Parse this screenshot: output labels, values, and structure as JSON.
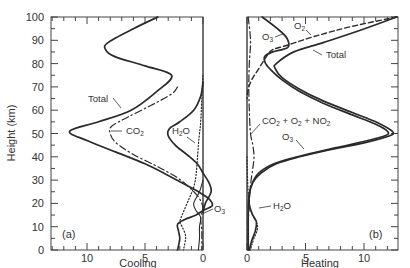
{
  "chart_data": [
    {
      "type": "line",
      "panel_label": "(a)",
      "xlabel": "Cooling",
      "ylabel": "Height (km)",
      "xlim": [
        13.7,
        -0.5
      ],
      "ylim": [
        0,
        100
      ],
      "x_ticks": [
        10,
        5,
        0
      ],
      "y_ticks": [
        0,
        10,
        20,
        30,
        40,
        50,
        60,
        70,
        80,
        90,
        100
      ],
      "x_reversed": true,
      "grid": false,
      "series": [
        {
          "name": "Total",
          "style": "solid",
          "points": [
            [
              3.9,
              100
            ],
            [
              6,
              95
            ],
            [
              8.2,
              89
            ],
            [
              8.4,
              86
            ],
            [
              7.6,
              83
            ],
            [
              5,
              79
            ],
            [
              2.7,
              75
            ],
            [
              4,
              68
            ],
            [
              6.2,
              60
            ],
            [
              9,
              55
            ],
            [
              11.5,
              51
            ],
            [
              10,
              47
            ],
            [
              7.5,
              42
            ],
            [
              5,
              37
            ],
            [
              3,
              32
            ],
            [
              1.5,
              28
            ],
            [
              0.4,
              25
            ],
            [
              -0.5,
              22
            ],
            [
              -0.8,
              19
            ],
            [
              0,
              17
            ],
            [
              0.6,
              15
            ],
            [
              1.6,
              13
            ],
            [
              2.2,
              11
            ],
            [
              2.1,
              8
            ],
            [
              2.0,
              5
            ],
            [
              2.1,
              2
            ],
            [
              2.2,
              0
            ]
          ]
        },
        {
          "name": "CO2",
          "style": "dash-dot",
          "points": [
            [
              2.2,
              70
            ],
            [
              2.7,
              67
            ],
            [
              4.5,
              62
            ],
            [
              6.5,
              57
            ],
            [
              7.9,
              53
            ],
            [
              8,
              50
            ],
            [
              7.5,
              46
            ],
            [
              6,
              41
            ],
            [
              4,
              36
            ],
            [
              2.2,
              31
            ],
            [
              1,
              26
            ],
            [
              0.3,
              22
            ],
            [
              0,
              18
            ],
            [
              0.2,
              14
            ],
            [
              0.1,
              8
            ],
            [
              0.1,
              0
            ]
          ]
        },
        {
          "name": "H2O",
          "style": "dotted",
          "points": [
            [
              0,
              75
            ],
            [
              0.1,
              65
            ],
            [
              0.2,
              55
            ],
            [
              0.3,
              50
            ],
            [
              0.4,
              45
            ],
            [
              0.5,
              38
            ],
            [
              0.6,
              32
            ],
            [
              0.8,
              27
            ],
            [
              1.2,
              22
            ],
            [
              1.8,
              15
            ],
            [
              2.0,
              12
            ],
            [
              1.8,
              10
            ],
            [
              1.5,
              6
            ],
            [
              1.6,
              2
            ],
            [
              1.7,
              0
            ]
          ]
        },
        {
          "name": "H2O (thick)",
          "style": "solid",
          "points": [
            [
              0,
              72
            ],
            [
              0.2,
              66
            ],
            [
              0.8,
              60
            ],
            [
              2,
              55
            ],
            [
              2.9,
              52
            ],
            [
              3.0,
              49
            ],
            [
              2.4,
              45
            ],
            [
              1.4,
              41
            ],
            [
              0.5,
              37
            ],
            [
              0,
              33
            ],
            [
              -0.5,
              29
            ],
            [
              -0.7,
              25
            ],
            [
              -0.2,
              20
            ],
            [
              0,
              16
            ]
          ]
        },
        {
          "name": "O3",
          "style": "solid-thin",
          "points": [
            [
              0,
              30
            ],
            [
              0.3,
              25
            ],
            [
              0.8,
              20
            ],
            [
              0.6,
              17
            ],
            [
              0.2,
              14
            ],
            [
              0.3,
              10
            ],
            [
              0.3,
              5
            ],
            [
              0.4,
              0
            ]
          ]
        }
      ],
      "annotations": [
        "Total",
        "CO2",
        "H2O",
        "O3",
        "(a)"
      ]
    },
    {
      "type": "line",
      "panel_label": "(b)",
      "xlabel": "Heating",
      "ylabel": "",
      "xlim": [
        -0.5,
        12.9
      ],
      "ylim": [
        0,
        100
      ],
      "x_ticks": [
        0,
        5,
        10
      ],
      "y_ticks": [
        0,
        10,
        20,
        30,
        40,
        50,
        60,
        70,
        80,
        90,
        100
      ],
      "grid": false,
      "series": [
        {
          "name": "Total",
          "style": "solid",
          "points": [
            [
              12.8,
              100
            ],
            [
              9.5,
              94
            ],
            [
              6.5,
              89
            ],
            [
              4,
              85
            ],
            [
              2.5,
              80
            ],
            [
              2.4,
              78
            ],
            [
              3,
              74
            ],
            [
              4.5,
              69
            ],
            [
              6.5,
              64
            ],
            [
              9,
              59
            ],
            [
              11,
              55
            ],
            [
              12.4,
              51
            ],
            [
              12.2,
              49
            ],
            [
              10,
              46
            ],
            [
              7,
              43
            ],
            [
              4.5,
              40
            ],
            [
              2.5,
              37
            ],
            [
              1.2,
              33
            ],
            [
              0.5,
              29
            ],
            [
              0.2,
              24
            ],
            [
              0.2,
              19
            ],
            [
              0.5,
              15
            ],
            [
              0.8,
              12
            ],
            [
              0.7,
              8
            ],
            [
              0.4,
              4
            ],
            [
              0.2,
              0
            ]
          ]
        },
        {
          "name": "O3",
          "style": "solid",
          "points": [
            [
              1.3,
              100
            ],
            [
              2.6,
              95
            ],
            [
              3.4,
              91
            ],
            [
              3.5,
              87
            ],
            [
              2.2,
              85
            ],
            [
              1.5,
              83
            ],
            [
              1.6,
              80
            ],
            [
              2.1,
              77
            ],
            [
              3,
              73
            ],
            [
              4.5,
              68
            ],
            [
              6.5,
              63
            ],
            [
              9,
              58
            ],
            [
              11,
              54
            ],
            [
              12,
              51
            ],
            [
              11.8,
              49
            ],
            [
              9.5,
              46
            ],
            [
              6.8,
              43
            ],
            [
              4.3,
              40
            ],
            [
              2.3,
              37
            ],
            [
              1.0,
              33
            ],
            [
              0.4,
              28
            ],
            [
              0.15,
              22
            ],
            [
              0.1,
              16
            ],
            [
              0.1,
              10
            ],
            [
              0.1,
              0
            ]
          ]
        },
        {
          "name": "O2",
          "style": "dashed",
          "points": [
            [
              12.8,
              100
            ],
            [
              9,
              96
            ],
            [
              6,
              92
            ],
            [
              3.5,
              88
            ],
            [
              2.2,
              86
            ],
            [
              1.8,
              84
            ],
            [
              1.4,
              81
            ],
            [
              0.9,
              77
            ],
            [
              0.4,
              73
            ],
            [
              0.1,
              69
            ],
            [
              0,
              65
            ]
          ]
        },
        {
          "name": "CO2 + O2 + NO2",
          "style": "dash-dot",
          "points": [
            [
              0.1,
              100
            ],
            [
              0.3,
              90
            ],
            [
              0.2,
              80
            ],
            [
              0.15,
              70
            ],
            [
              0.2,
              60
            ],
            [
              0.3,
              50
            ],
            [
              0.5,
              45
            ],
            [
              0.6,
              40
            ],
            [
              0.5,
              35
            ],
            [
              0.3,
              28
            ],
            [
              0.2,
              20
            ],
            [
              0.1,
              10
            ],
            [
              0.1,
              0
            ]
          ]
        },
        {
          "name": "H2O",
          "style": "dotted",
          "points": [
            [
              0,
              40
            ],
            [
              0.05,
              30
            ],
            [
              0.15,
              22
            ],
            [
              0.4,
              16
            ],
            [
              0.8,
              12
            ],
            [
              0.9,
              9
            ],
            [
              0.6,
              5
            ],
            [
              0.4,
              2
            ],
            [
              0.3,
              0
            ]
          ]
        }
      ],
      "annotations": [
        "O3",
        "O2",
        "Total",
        "CO2 + O2 + NO2",
        "O3",
        "H2O",
        "(b)"
      ]
    }
  ],
  "labels": {
    "ylabel": "Height (km)",
    "y_ticks": [
      "100",
      "90",
      "80",
      "70",
      "60",
      "50",
      "40",
      "30",
      "20",
      "10",
      "0"
    ],
    "left": {
      "panel": "(a)",
      "xlabel": "Cooling",
      "x_ticks": [
        "10",
        "5",
        "0"
      ],
      "total": "Total",
      "co2": "CO",
      "co2_sub": "2",
      "h2o_h": "H",
      "h2o_sub": "2",
      "h2o_o": "O",
      "o3": "O",
      "o3_sub": "3"
    },
    "right": {
      "panel": "(b)",
      "xlabel": "Heating",
      "x_ticks": [
        "0",
        "5",
        "10"
      ],
      "o3_top": "O",
      "o3_top_sub": "3",
      "o2": "O",
      "o2_sub": "2",
      "total": "Total",
      "mix_a": "CO",
      "mix_a_sub": "2",
      "mix_b": " + O",
      "mix_b_sub": "2",
      "mix_c": " + NO",
      "mix_c_sub": "2",
      "o3": "O",
      "o3_sub": "3",
      "h2o_h": "H",
      "h2o_sub": "2",
      "h2o_o": "O"
    }
  },
  "colors": {
    "line": "#2a2a2a",
    "axis": "#444444",
    "text": "#333333",
    "background": "#ffffff"
  }
}
